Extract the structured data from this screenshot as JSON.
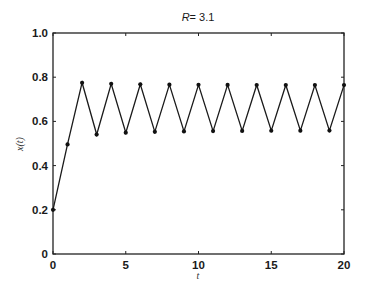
{
  "chart_data": {
    "type": "line",
    "title_var": "R",
    "title_rest": "= 3.1",
    "xlabel": "t",
    "ylabel": "x(t)",
    "xlim": [
      0,
      20
    ],
    "ylim": [
      0,
      1.0
    ],
    "grid": false,
    "x_ticks": [
      0,
      5,
      10,
      15,
      20
    ],
    "x_tick_labels": [
      "0",
      "5",
      "10",
      "15",
      "20"
    ],
    "y_ticks": [
      0,
      0.2,
      0.4,
      0.6,
      0.8,
      1.0
    ],
    "y_tick_labels": [
      "0",
      "0.2",
      "0.4",
      "0.6",
      "0.8",
      "1.0"
    ],
    "series": [
      {
        "name": "x(t)",
        "markers": true,
        "x": [
          0,
          1,
          2,
          3,
          4,
          5,
          6,
          7,
          8,
          9,
          10,
          11,
          12,
          13,
          14,
          15,
          16,
          17,
          18,
          19,
          20
        ],
        "values": [
          0.2,
          0.496,
          0.775,
          0.5406,
          0.7699,
          0.549,
          0.7677,
          0.5527,
          0.7664,
          0.5548,
          0.7656,
          0.5562,
          0.7651,
          0.5571,
          0.7647,
          0.5577,
          0.7645,
          0.5581,
          0.7644,
          0.5583,
          0.7643
        ]
      }
    ]
  }
}
